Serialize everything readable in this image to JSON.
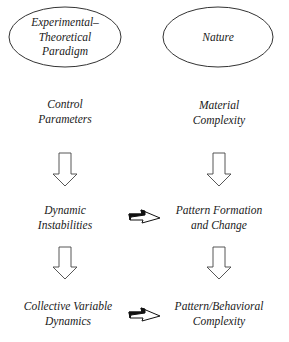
{
  "diagram": {
    "nodes": {
      "paradigm": {
        "lines": [
          "Experimental–",
          "Theoretical",
          "Paradigm"
        ],
        "shape": "ellipse"
      },
      "nature": {
        "lines": [
          "Nature"
        ],
        "shape": "ellipse"
      },
      "control_parameters": {
        "lines": [
          "Control",
          "Parameters"
        ]
      },
      "material_complexity": {
        "lines": [
          "Material",
          "Complexity"
        ]
      },
      "dynamic_instabilities": {
        "lines": [
          "Dynamic",
          "Instabilities"
        ]
      },
      "pattern_formation": {
        "lines": [
          "Pattern Formation",
          "and Change"
        ]
      },
      "collective_dynamics": {
        "lines": [
          "Collective Variable",
          "Dynamics"
        ]
      },
      "behavioral_complexity": {
        "lines": [
          "Pattern/Behavioral",
          "Complexity"
        ]
      }
    },
    "edges": [
      {
        "from": "control_parameters",
        "to": "dynamic_instabilities",
        "style": "hollow-down-arrow"
      },
      {
        "from": "dynamic_instabilities",
        "to": "collective_dynamics",
        "style": "hollow-down-arrow"
      },
      {
        "from": "material_complexity",
        "to": "pattern_formation",
        "style": "hollow-down-arrow"
      },
      {
        "from": "pattern_formation",
        "to": "behavioral_complexity",
        "style": "hollow-down-arrow"
      },
      {
        "from": "dynamic_instabilities",
        "to": "pattern_formation",
        "style": "twisted-bidirectional-arrow"
      },
      {
        "from": "collective_dynamics",
        "to": "behavioral_complexity",
        "style": "twisted-bidirectional-arrow"
      }
    ],
    "colors": {
      "stroke": "#333333",
      "text": "#1a1a1a",
      "background": "#ffffff"
    }
  }
}
